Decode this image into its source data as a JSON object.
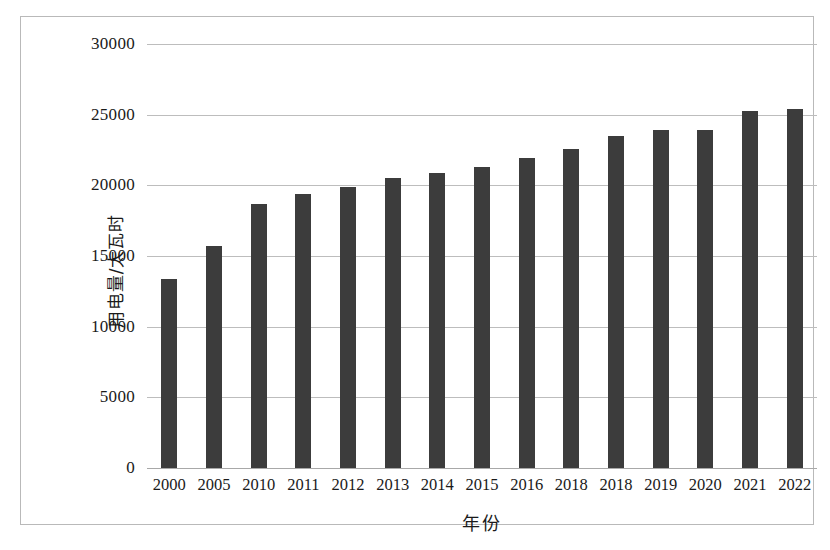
{
  "chart_data": {
    "type": "bar",
    "title": "",
    "xlabel": "年份",
    "ylabel": "用电量/太瓦时",
    "categories": [
      "2000",
      "2005",
      "2010",
      "2011",
      "2012",
      "2013",
      "2014",
      "2015",
      "2016",
      "2018",
      "2018",
      "2019",
      "2020",
      "2021",
      "2022"
    ],
    "values": [
      13400,
      15700,
      18700,
      19400,
      19900,
      20500,
      20900,
      21300,
      21900,
      22600,
      23500,
      23900,
      23900,
      25250,
      25400
    ],
    "series": [
      {
        "name": "用电量",
        "values": [
          13400,
          15700,
          18700,
          19400,
          19900,
          20500,
          20900,
          21300,
          21900,
          22600,
          23500,
          23900,
          23900,
          25250,
          25400
        ]
      }
    ],
    "ylim": [
      0,
      30000
    ],
    "yticks": [
      0,
      5000,
      10000,
      15000,
      20000,
      25000,
      30000
    ],
    "ytick_labels": [
      "0",
      "5000",
      "10000",
      "15000",
      "20000",
      "25000",
      "30000"
    ],
    "grid": true,
    "grid_axis": "y",
    "legend": false,
    "legend_position": "none",
    "bar_color": "#3c3c3c",
    "gridline_color": "#bdbdbd",
    "background_color": "#ffffff",
    "border_color": "#b9b9b9"
  }
}
